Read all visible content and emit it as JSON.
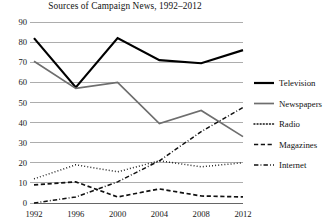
{
  "chart_data": {
    "type": "line",
    "title": "Sources of Campaign News, 1992–2012",
    "xlabel": "",
    "ylabel": "",
    "x": [
      1992,
      1996,
      2000,
      2004,
      2008,
      2012
    ],
    "categories": [
      "1992",
      "1996",
      "2000",
      "2004",
      "2008",
      "2012"
    ],
    "xlim": [
      1992,
      2012
    ],
    "ylim": [
      0,
      90
    ],
    "yticks": [
      0,
      10,
      20,
      30,
      40,
      50,
      60,
      70,
      80,
      90
    ],
    "ytick_labels": [
      "0",
      "10",
      "20",
      "30",
      "40",
      "50",
      "60",
      "70",
      "80",
      "90"
    ],
    "grid": true,
    "legend_position": "right",
    "series": [
      {
        "name": "Television",
        "values": [
          82,
          57.5,
          82,
          71,
          69.5,
          76
        ],
        "color": "#000000",
        "style": "solid",
        "width": 2.2
      },
      {
        "name": "Newspapers",
        "values": [
          70.5,
          57,
          60,
          39.5,
          46,
          33
        ],
        "color": "#6e6e6e",
        "style": "solid",
        "width": 1.7
      },
      {
        "name": "Radio",
        "values": [
          12,
          19,
          15.5,
          21,
          18,
          20
        ],
        "color": "#111111",
        "style": "dotted",
        "width": 1.5
      },
      {
        "name": "Magazines",
        "values": [
          9,
          10.5,
          3,
          7,
          3.5,
          3
        ],
        "color": "#111111",
        "style": "dashed",
        "width": 1.7
      },
      {
        "name": "Internet",
        "values": [
          0,
          3,
          10.5,
          21,
          35.5,
          47.5
        ],
        "color": "#111111",
        "style": "dashdot",
        "width": 1.5
      }
    ]
  },
  "legend": {
    "items": [
      {
        "label": "Television"
      },
      {
        "label": "Newspapers"
      },
      {
        "label": "Radio"
      },
      {
        "label": "Magazines"
      },
      {
        "label": "Internet"
      }
    ]
  }
}
